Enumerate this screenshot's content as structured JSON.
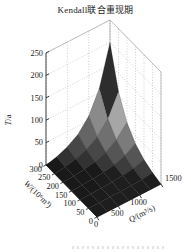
{
  "title": "Kendall联合重现期",
  "chart_data": {
    "type": "surface",
    "title": "Kendall联合重现期",
    "xlabel": "Q/(m³/s)",
    "ylabel": "W/(10⁶m³)",
    "zlabel": "T/a",
    "x_ticks": [
      0,
      500,
      1000,
      1500
    ],
    "y_ticks": [
      0,
      50,
      100,
      150,
      200,
      250,
      300
    ],
    "z_ticks": [
      0,
      50,
      100,
      150,
      200,
      250
    ],
    "xlim": [
      0,
      1500
    ],
    "ylim": [
      0,
      300
    ],
    "zlim": [
      0,
      250
    ],
    "grid": true,
    "x": [
      0,
      250,
      500,
      750,
      1000,
      1250,
      1500
    ],
    "y": [
      0,
      50,
      100,
      150,
      200,
      250,
      300
    ],
    "z": [
      [
        0,
        0,
        0,
        0,
        0,
        0,
        0
      ],
      [
        0,
        0.2,
        0.5,
        1.0,
        1.8,
        3.3,
        6
      ],
      [
        0,
        0.5,
        1.3,
        2.6,
        4.8,
        8.8,
        16
      ],
      [
        0,
        1.0,
        2.6,
        5.1,
        9.6,
        17.6,
        32
      ],
      [
        0,
        1.8,
        4.8,
        9.6,
        18,
        33,
        60
      ],
      [
        0,
        3.3,
        8.8,
        17.6,
        33,
        60.5,
        110
      ],
      [
        0,
        6,
        16,
        32,
        60,
        110,
        200
      ]
    ],
    "colors": {
      "bands": [
        {
          "min": 0.5,
          "color": "#2f2f2f"
        },
        {
          "min": 0.25,
          "color": "#a0a0a0"
        },
        {
          "min": 0.135,
          "color": "#767676"
        },
        {
          "min": 0.068,
          "color": "#525252"
        },
        {
          "min": 0.03,
          "color": "#3a3a3a"
        },
        {
          "min": 0,
          "color": "#1d1d1d"
        }
      ],
      "mesh_line": "rgba(0,0,0,0.35)",
      "grid_line": "#b3b3b3",
      "box_edge": "#a8a8a8",
      "axis": "#111111",
      "text": "#1a1a1a",
      "background": "#ffffff"
    }
  }
}
